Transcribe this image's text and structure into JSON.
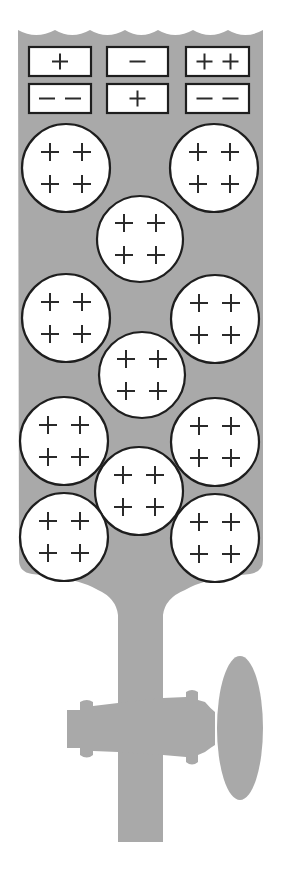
{
  "figure": {
    "liquid_color": "#a9a9a9",
    "outline_color": "#1e1e1e",
    "background": "#ffffff"
  },
  "ions": [
    {
      "id": "ion-1",
      "charge": "+",
      "x": 29,
      "y": 47,
      "w": 62,
      "h": 29
    },
    {
      "id": "ion-2",
      "charge": "−",
      "x": 107,
      "y": 47,
      "w": 61,
      "h": 29
    },
    {
      "id": "ion-3",
      "charge": "++",
      "x": 186,
      "y": 47,
      "w": 63,
      "h": 29
    },
    {
      "id": "ion-4",
      "charge": "−−",
      "x": 29,
      "y": 84,
      "w": 62,
      "h": 29
    },
    {
      "id": "ion-5",
      "charge": "+",
      "x": 107,
      "y": 84,
      "w": 61,
      "h": 29
    },
    {
      "id": "ion-6",
      "charge": "−−",
      "x": 186,
      "y": 84,
      "w": 63,
      "h": 29
    }
  ],
  "particles": [
    {
      "id": "particle-1",
      "cx": 66,
      "cy": 168,
      "r": 44,
      "charge": "++++"
    },
    {
      "id": "particle-2",
      "cx": 214,
      "cy": 168,
      "r": 44,
      "charge": "++++"
    },
    {
      "id": "particle-3",
      "cx": 140,
      "cy": 239,
      "r": 43,
      "charge": "++++"
    },
    {
      "id": "particle-4",
      "cx": 66,
      "cy": 318,
      "r": 44,
      "charge": "++++"
    },
    {
      "id": "particle-5",
      "cx": 215,
      "cy": 319,
      "r": 44,
      "charge": "++++"
    },
    {
      "id": "particle-6",
      "cx": 142,
      "cy": 375,
      "r": 43,
      "charge": "++++"
    },
    {
      "id": "particle-7",
      "cx": 64,
      "cy": 441,
      "r": 44,
      "charge": "++++"
    },
    {
      "id": "particle-8",
      "cx": 215,
      "cy": 442,
      "r": 44,
      "charge": "++++"
    },
    {
      "id": "particle-9",
      "cx": 139,
      "cy": 491,
      "r": 44,
      "charge": "++++"
    },
    {
      "id": "particle-10",
      "cx": 64,
      "cy": 537,
      "r": 44,
      "charge": "++++"
    },
    {
      "id": "particle-11",
      "cx": 215,
      "cy": 538,
      "r": 44,
      "charge": "++++"
    }
  ],
  "labels": {
    "plus": "+",
    "minus": "−",
    "stopcock": "stopcock",
    "liquid": "liquid column"
  }
}
